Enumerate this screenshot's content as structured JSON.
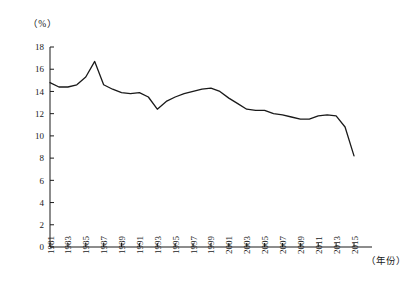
{
  "figure": {
    "unit_label": "（%）",
    "xaxis_title": "（年份）"
  },
  "chart_data": {
    "type": "line",
    "title": "",
    "xlabel": "（年份）",
    "ylabel": "（%）",
    "xlim": [
      1981,
      2015
    ],
    "ylim": [
      0,
      18
    ],
    "ytick_step": 2,
    "xtick_step": 2,
    "grid": false,
    "legend": "none",
    "line_color": "#1a1a1a",
    "x": [
      1981,
      1982,
      1983,
      1984,
      1985,
      1986,
      1987,
      1988,
      1989,
      1990,
      1991,
      1992,
      1993,
      1994,
      1995,
      1996,
      1997,
      1998,
      1999,
      2000,
      2001,
      2002,
      2003,
      2004,
      2005,
      2006,
      2007,
      2008,
      2009,
      2010,
      2011,
      2012,
      2013,
      2014,
      2015
    ],
    "values": [
      14.8,
      14.4,
      14.4,
      14.6,
      15.3,
      16.7,
      14.6,
      14.2,
      13.9,
      13.8,
      13.9,
      13.5,
      12.4,
      13.1,
      13.5,
      13.8,
      14.0,
      14.2,
      14.3,
      14.0,
      13.4,
      12.9,
      12.4,
      12.3,
      12.3,
      12.0,
      11.9,
      11.7,
      11.5,
      11.5,
      11.8,
      11.9,
      11.8,
      10.8,
      8.2
    ],
    "ytick_labels": [
      "0",
      "2",
      "4",
      "6",
      "8",
      "10",
      "12",
      "14",
      "16",
      "18"
    ],
    "ytick_values": [
      0,
      2,
      4,
      6,
      8,
      10,
      12,
      14,
      16,
      18
    ],
    "xtick_labels": [
      "1981",
      "1983",
      "1985",
      "1987",
      "1989",
      "1991",
      "1993",
      "1995",
      "1997",
      "1999",
      "2001",
      "2003",
      "2005",
      "2007",
      "2009",
      "2011",
      "2013",
      "2015"
    ],
    "xtick_values": [
      1981,
      1983,
      1985,
      1987,
      1989,
      1991,
      1993,
      1995,
      1997,
      1999,
      2001,
      2003,
      2005,
      2007,
      2009,
      2011,
      2013,
      2015
    ]
  }
}
